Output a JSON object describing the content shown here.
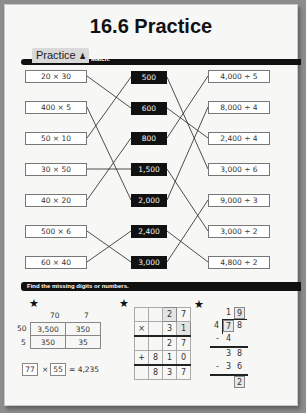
{
  "title": "16.6 Practice",
  "section1": {
    "tab_label": "Practice",
    "tab_icon": "person-icon",
    "instruction": "Match."
  },
  "matching": {
    "left": [
      "20 × 30",
      "400 × 5",
      "50 × 10",
      "30 × 50",
      "40 × 20",
      "500 × 6",
      "60 × 40"
    ],
    "middle": [
      "500",
      "600",
      "800",
      "1,500",
      "2,000",
      "2,400",
      "3,000"
    ],
    "right": [
      "4,000 ÷ 5",
      "8,000 ÷ 4",
      "2,400 ÷ 4",
      "3,000 ÷ 6",
      "9,000 ÷ 3",
      "3,000 ÷ 2",
      "4,800 ÷ 2"
    ],
    "left_to_middle": [
      [
        0,
        1
      ],
      [
        1,
        4
      ],
      [
        2,
        0
      ],
      [
        3,
        3
      ],
      [
        4,
        2
      ],
      [
        5,
        6
      ],
      [
        6,
        5
      ]
    ],
    "middle_to_right": [
      [
        0,
        3
      ],
      [
        1,
        2
      ],
      [
        2,
        0
      ],
      [
        3,
        5
      ],
      [
        4,
        1
      ],
      [
        5,
        6
      ],
      [
        6,
        4
      ]
    ]
  },
  "section2": {
    "instruction": "Find the missing digits or numbers."
  },
  "area_model": {
    "col_headers": [
      "70",
      "7"
    ],
    "row_headers": [
      "50",
      "5"
    ],
    "cells": [
      [
        "3,500",
        "350"
      ],
      [
        "350",
        "35"
      ]
    ],
    "factor1": "77",
    "times": "×",
    "factor2": "55",
    "result": "= 4,235"
  },
  "long_multiplication": {
    "rows": [
      [
        "",
        "",
        "2",
        "7"
      ],
      [
        "×",
        "",
        "3",
        "1"
      ],
      [
        "",
        "",
        "2",
        "7"
      ],
      [
        "+",
        "8",
        "1",
        "0"
      ],
      [
        "",
        "8",
        "3",
        "7"
      ]
    ]
  },
  "long_division": {
    "quotient": [
      "1",
      "9"
    ],
    "divisor": "4",
    "dividend": [
      "7",
      "8"
    ],
    "step1": [
      "-",
      "4"
    ],
    "step2": [
      "3",
      "8"
    ],
    "step3": [
      "-",
      "3",
      "6"
    ],
    "remainder": "2"
  }
}
